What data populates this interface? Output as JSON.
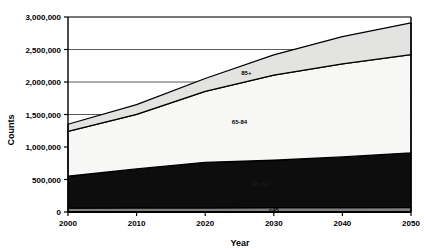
{
  "chart_data": {
    "type": "area",
    "title": "",
    "xlabel": "Year",
    "ylabel": "Counts",
    "x": [
      2000,
      2010,
      2020,
      2030,
      2040,
      2050
    ],
    "xlim": [
      2000,
      2050
    ],
    "ylim": [
      0,
      3000000
    ],
    "grid": true,
    "stacked": true,
    "legend_position": "inline-labels",
    "xticks": [
      "2000",
      "2010",
      "2020",
      "2030",
      "2040",
      "2050"
    ],
    "yticks": [
      "0",
      "500,000",
      "1,000,000",
      "1,500,000",
      "2,000,000",
      "2,500,000",
      "3,000,000"
    ],
    "ytick_values": [
      0,
      500000,
      1000000,
      1500000,
      2000000,
      2500000,
      3000000
    ],
    "series": [
      {
        "name": "<45",
        "color": "#808080",
        "label": "<45",
        "values": [
          60000,
          62000,
          64000,
          66000,
          68000,
          70000
        ]
      },
      {
        "name": "45-64",
        "color": "#0d0d0d",
        "label": "45-64",
        "values": [
          490000,
          600000,
          700000,
          730000,
          780000,
          840000
        ]
      },
      {
        "name": "65-84",
        "color": "#f7f7f5",
        "label": "65-84",
        "values": [
          690000,
          840000,
          1090000,
          1310000,
          1430000,
          1510000
        ]
      },
      {
        "name": "85+",
        "color": "#e3e3e1",
        "label": "85+",
        "values": [
          110000,
          150000,
          200000,
          310000,
          420000,
          490000
        ]
      }
    ],
    "cumulative_totals": [
      1350000,
      1652000,
      2054000,
      2416000,
      2698000,
      2910000
    ]
  },
  "axes": {
    "y_label": "Counts",
    "x_label": "Year"
  }
}
